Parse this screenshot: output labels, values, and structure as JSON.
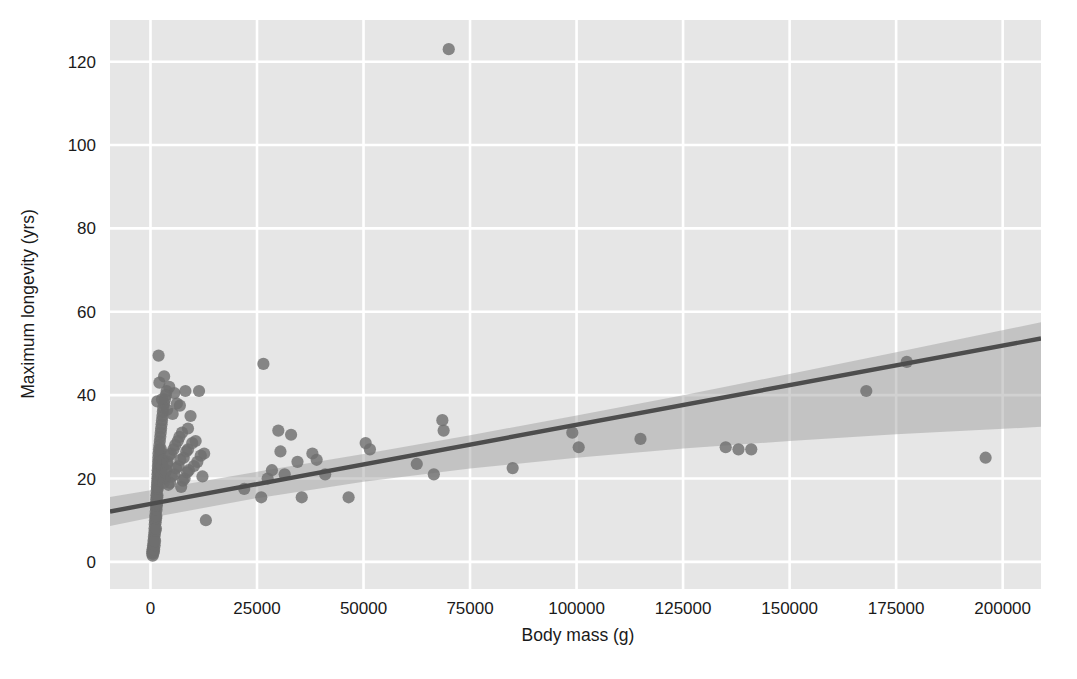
{
  "figure": {
    "width": 1077,
    "height": 679,
    "background_color": "#ffffff",
    "panel_background_color": "#e6e6e6",
    "grid_color": "#ffffff",
    "marker_color": "#6f6f6f",
    "line_color": "#4d4d4d",
    "band_color": "#9a9a9a"
  },
  "chart_data": {
    "type": "scatter",
    "title": "",
    "xlabel": "Body mass (g)",
    "ylabel": "Maximum longevity (yrs)",
    "xlim": [
      -9500,
      209000
    ],
    "ylim": [
      -6.5,
      130
    ],
    "xticks": [
      0,
      25000,
      50000,
      75000,
      100000,
      125000,
      150000,
      175000,
      200000
    ],
    "xticklabels": [
      "0",
      "25000",
      "50000",
      "75000",
      "100000",
      "125000",
      "150000",
      "175000",
      "200000"
    ],
    "yticks": [
      0,
      20,
      40,
      60,
      80,
      100,
      120
    ],
    "yticklabels": [
      "0",
      "20",
      "40",
      "60",
      "80",
      "100",
      "120"
    ],
    "grid": true,
    "legend": null,
    "regression": {
      "type": "linear-fit",
      "slope": 0.00019,
      "intercept": 13.9,
      "x_start": -9500,
      "x_end": 209000,
      "y_start": 12.1,
      "y_end": 53.6,
      "confidence_band": {
        "label": "95% CI",
        "x": [
          -9500,
          0,
          25000,
          50000,
          75000,
          100000,
          125000,
          150000,
          175000,
          209000
        ],
        "lower": [
          8.6,
          10.6,
          15.3,
          19.2,
          22.4,
          25.0,
          27.2,
          29.0,
          30.6,
          32.4
        ],
        "upper": [
          15.6,
          17.2,
          21.6,
          25.9,
          30.4,
          35.1,
          40.0,
          45.1,
          50.3,
          57.5
        ]
      }
    },
    "points": [
      [
        400,
        2.0
      ],
      [
        450,
        2.5
      ],
      [
        500,
        3.0
      ],
      [
        520,
        1.5
      ],
      [
        600,
        4.0
      ],
      [
        650,
        2.0
      ],
      [
        700,
        5.0
      ],
      [
        720,
        3.5
      ],
      [
        780,
        2.5
      ],
      [
        800,
        6.0
      ],
      [
        820,
        4.5
      ],
      [
        850,
        3.0
      ],
      [
        900,
        7.0
      ],
      [
        920,
        5.5
      ],
      [
        950,
        8.0
      ],
      [
        980,
        4.0
      ],
      [
        1000,
        9.0
      ],
      [
        1020,
        6.5
      ],
      [
        1050,
        10.0
      ],
      [
        1080,
        5.0
      ],
      [
        1100,
        11.0
      ],
      [
        1150,
        7.5
      ],
      [
        1200,
        12.0
      ],
      [
        1220,
        9.5
      ],
      [
        1250,
        13.0
      ],
      [
        1280,
        8.0
      ],
      [
        1300,
        14.0
      ],
      [
        1320,
        10.5
      ],
      [
        1350,
        15.0
      ],
      [
        1380,
        11.0
      ],
      [
        1400,
        16.0
      ],
      [
        1420,
        12.5
      ],
      [
        1450,
        17.0
      ],
      [
        1480,
        13.5
      ],
      [
        1500,
        18.0
      ],
      [
        1520,
        14.0
      ],
      [
        1550,
        19.0
      ],
      [
        1580,
        15.5
      ],
      [
        1600,
        20.0
      ],
      [
        1620,
        16.0
      ],
      [
        1650,
        21.0
      ],
      [
        1680,
        17.5
      ],
      [
        1700,
        22.0
      ],
      [
        1720,
        18.0
      ],
      [
        1750,
        23.0
      ],
      [
        1780,
        19.5
      ],
      [
        1800,
        24.0
      ],
      [
        1820,
        20.0
      ],
      [
        1850,
        25.0
      ],
      [
        1880,
        21.5
      ],
      [
        1900,
        26.0
      ],
      [
        1950,
        22.0
      ],
      [
        2000,
        27.0
      ],
      [
        2050,
        23.5
      ],
      [
        2100,
        28.0
      ],
      [
        2150,
        24.0
      ],
      [
        2200,
        29.0
      ],
      [
        2250,
        25.0
      ],
      [
        2300,
        30.0
      ],
      [
        2350,
        26.5
      ],
      [
        2400,
        31.0
      ],
      [
        2450,
        27.0
      ],
      [
        2500,
        32.0
      ],
      [
        2550,
        20.5
      ],
      [
        2600,
        33.0
      ],
      [
        2650,
        21.0
      ],
      [
        2700,
        34.0
      ],
      [
        2750,
        22.5
      ],
      [
        2800,
        35.0
      ],
      [
        2850,
        23.0
      ],
      [
        2900,
        36.0
      ],
      [
        2950,
        24.5
      ],
      [
        3000,
        37.0
      ],
      [
        3100,
        19.0
      ],
      [
        3200,
        38.0
      ],
      [
        3300,
        20.0
      ],
      [
        3400,
        39.0
      ],
      [
        3500,
        21.5
      ],
      [
        3600,
        40.0
      ],
      [
        3700,
        22.0
      ],
      [
        3800,
        41.0
      ],
      [
        3900,
        23.5
      ],
      [
        4000,
        24.0
      ],
      [
        4200,
        18.5
      ],
      [
        4400,
        25.5
      ],
      [
        4600,
        19.0
      ],
      [
        4800,
        26.0
      ],
      [
        5000,
        20.5
      ],
      [
        5200,
        35.5
      ],
      [
        5400,
        27.0
      ],
      [
        5600,
        21.0
      ],
      [
        5800,
        28.0
      ],
      [
        6000,
        22.5
      ],
      [
        6200,
        38.0
      ],
      [
        6400,
        29.0
      ],
      [
        6600,
        23.0
      ],
      [
        6800,
        30.0
      ],
      [
        7000,
        24.5
      ],
      [
        7200,
        18.0
      ],
      [
        7400,
        31.0
      ],
      [
        7600,
        19.5
      ],
      [
        7800,
        25.0
      ],
      [
        8000,
        20.0
      ],
      [
        8200,
        41.0
      ],
      [
        8400,
        26.5
      ],
      [
        8600,
        21.5
      ],
      [
        8800,
        27.0
      ],
      [
        9000,
        22.0
      ],
      [
        9400,
        35.0
      ],
      [
        9800,
        28.5
      ],
      [
        10200,
        23.0
      ],
      [
        10600,
        29.0
      ],
      [
        11000,
        24.0
      ],
      [
        11400,
        41.0
      ],
      [
        11800,
        25.5
      ],
      [
        12200,
        20.5
      ],
      [
        12600,
        26.0
      ],
      [
        13000,
        10.0
      ],
      [
        1900,
        49.5
      ],
      [
        3200,
        44.5
      ],
      [
        2100,
        43.0
      ],
      [
        4400,
        42.0
      ],
      [
        5600,
        40.5
      ],
      [
        2700,
        39.0
      ],
      [
        6900,
        37.5
      ],
      [
        3900,
        36.5
      ],
      [
        1600,
        38.5
      ],
      [
        8800,
        32.0
      ],
      [
        22000,
        17.5
      ],
      [
        26000,
        15.5
      ],
      [
        26500,
        47.5
      ],
      [
        27500,
        20.0
      ],
      [
        28500,
        22.0
      ],
      [
        30000,
        31.5
      ],
      [
        30500,
        26.5
      ],
      [
        31500,
        21.0
      ],
      [
        33000,
        30.5
      ],
      [
        34500,
        24.0
      ],
      [
        35500,
        15.5
      ],
      [
        38000,
        26.0
      ],
      [
        39000,
        24.5
      ],
      [
        41000,
        21.0
      ],
      [
        46500,
        15.5
      ],
      [
        50500,
        28.5
      ],
      [
        51500,
        27.0
      ],
      [
        62500,
        23.5
      ],
      [
        66500,
        21.0
      ],
      [
        68500,
        34.0
      ],
      [
        68800,
        31.5
      ],
      [
        70000,
        123.0
      ],
      [
        85000,
        22.5
      ],
      [
        99000,
        31.0
      ],
      [
        100500,
        27.5
      ],
      [
        115000,
        29.5
      ],
      [
        135000,
        27.5
      ],
      [
        138000,
        27.0
      ],
      [
        141000,
        27.0
      ],
      [
        168000,
        41.0
      ],
      [
        177500,
        48.0
      ],
      [
        196000,
        25.0
      ]
    ]
  }
}
